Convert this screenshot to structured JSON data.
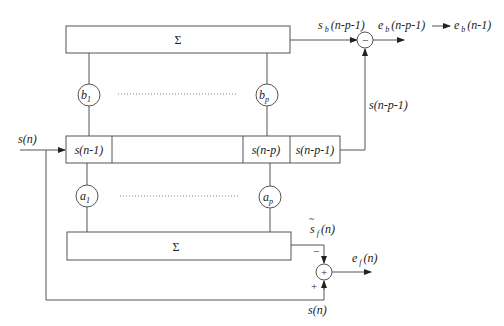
{
  "diagram": {
    "type": "lattice-predictor-block-diagram",
    "top_sum": {
      "symbol": "Σ"
    },
    "bottom_sum": {
      "symbol": "Σ"
    },
    "backward_coeffs": {
      "first": "b",
      "first_sub": "1",
      "last": "b",
      "last_sub": "p"
    },
    "forward_coeffs": {
      "first": "a",
      "first_sub": "1",
      "last": "a",
      "last_sub": "p"
    },
    "register": {
      "cells": [
        "s(n-1)",
        "",
        "s(n-p)",
        "s(n-p-1)"
      ]
    },
    "labels": {
      "input": "s(n)",
      "sb_main": "s",
      "sb_sub": "b",
      "sb_arg": "(n-p-1)",
      "eb_main": "e",
      "eb_sub": "b",
      "eb_arg": "(n-p-1)",
      "eb_delayed_main": "e",
      "eb_delayed_sub": "b",
      "eb_delayed_arg": "(n-1)",
      "feedback": "s(n-p-1)",
      "sf_main": "s",
      "sf_tilde": "~",
      "sf_sub": "f",
      "sf_arg": "(n)",
      "ef_main": "e",
      "ef_sub": "f",
      "ef_arg": "(n)",
      "bottom_input": "s(n)",
      "minus_sign": "−",
      "plus_sign": "+",
      "subtractor_symbol": "−",
      "adder_symbol": "+"
    }
  }
}
